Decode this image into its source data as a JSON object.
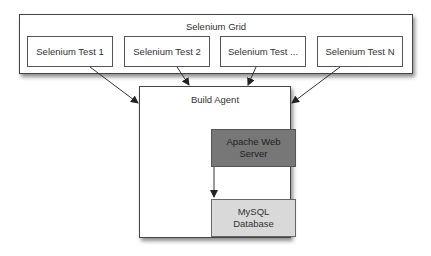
{
  "grid": {
    "title": "Selenium Grid",
    "tests": [
      {
        "label": "Selenium Test 1"
      },
      {
        "label": "Selenium Test 2"
      },
      {
        "label": "Selenium Test ..."
      },
      {
        "label": "Selenium Test N"
      }
    ]
  },
  "agent": {
    "title": "Build Agent",
    "web_server": {
      "line1": "Apache Web",
      "line2": "Server",
      "fill": "#777777"
    },
    "database": {
      "line1": "MySQL",
      "line2": "Database",
      "fill": "#d9d9d9"
    }
  }
}
